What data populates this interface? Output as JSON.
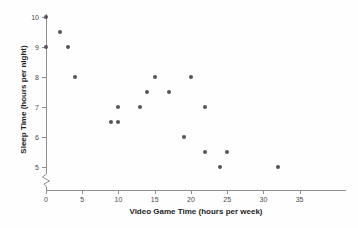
{
  "chart_data": {
    "type": "scatter",
    "title": "",
    "xlabel": "Video Game Time (hours per week)",
    "ylabel": "Sleep Time (hours per night)",
    "xlim": [
      0,
      38.5
    ],
    "ylim": [
      4.6,
      10.4
    ],
    "xticks": [
      0,
      5,
      10,
      15,
      20,
      25,
      30,
      35
    ],
    "xticklabels": [
      "0",
      "5",
      "10",
      "15",
      "20",
      "25",
      "30",
      "35"
    ],
    "yticks": [
      5,
      6,
      7,
      8,
      9,
      10
    ],
    "yticklabels": [
      "5",
      "6",
      "7",
      "8",
      "9",
      "10"
    ],
    "grid": false,
    "legend": false,
    "y_axis_break": true,
    "marker_color": "#54545c",
    "axis_color": "#8e8e8e",
    "points": [
      {
        "x": 0,
        "y": 10
      },
      {
        "x": 0,
        "y": 9
      },
      {
        "x": 2,
        "y": 9.5
      },
      {
        "x": 3,
        "y": 9
      },
      {
        "x": 4,
        "y": 8
      },
      {
        "x": 9,
        "y": 6.5
      },
      {
        "x": 10,
        "y": 6.5
      },
      {
        "x": 10,
        "y": 7
      },
      {
        "x": 13,
        "y": 7
      },
      {
        "x": 14,
        "y": 7.5
      },
      {
        "x": 15,
        "y": 8
      },
      {
        "x": 17,
        "y": 7.5
      },
      {
        "x": 19,
        "y": 6
      },
      {
        "x": 20,
        "y": 8
      },
      {
        "x": 22,
        "y": 7
      },
      {
        "x": 22,
        "y": 5.5
      },
      {
        "x": 24,
        "y": 5
      },
      {
        "x": 25,
        "y": 5.5
      },
      {
        "x": 32,
        "y": 5
      }
    ]
  }
}
